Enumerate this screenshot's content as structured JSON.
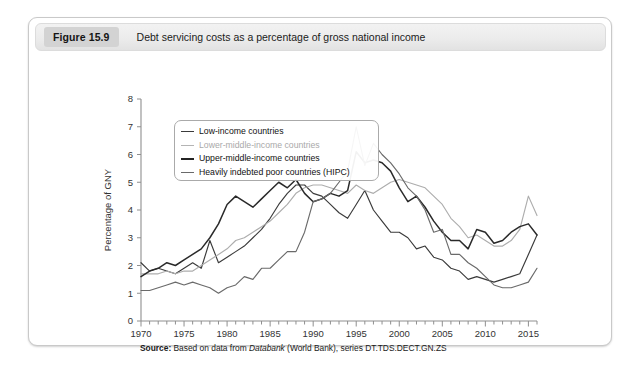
{
  "figure": {
    "badge": "Figure 15.9",
    "caption": "Debt servicing costs as a percentage of gross national income",
    "source_prefix": "Source:",
    "source_text_1": " Based on data from ",
    "source_db": "Databank",
    "source_text_2": " (World Bank), series DT.TDS.DECT.GN.ZS"
  },
  "legend": {
    "items": [
      {
        "label": "Low-income countries",
        "color": "#3b3b3b"
      },
      {
        "label": "Lower-middle-income countries",
        "color": "#b4b4b4"
      },
      {
        "label": "Upper-middle-income countries",
        "color": "#242424"
      },
      {
        "label": "Heavily indebted poor countries (HIPC)",
        "color": "#6a6a6a"
      }
    ]
  },
  "chart_data": {
    "type": "line",
    "title": "Debt servicing costs as a percentage of gross national income",
    "xlabel": "",
    "ylabel": "Percentage of GNY",
    "xlim": [
      1970,
      2016
    ],
    "ylim": [
      0,
      8
    ],
    "y_ticks": [
      0,
      1,
      2,
      3,
      4,
      5,
      6,
      7,
      8
    ],
    "x_ticks_major": [
      1970,
      1975,
      1980,
      1985,
      1990,
      1995,
      2000,
      2005,
      2010,
      2015
    ],
    "x_tick_interval_minor": 1,
    "grid": false,
    "legend_position": "top-left-inside",
    "x": [
      1970,
      1971,
      1972,
      1973,
      1974,
      1975,
      1976,
      1977,
      1978,
      1979,
      1980,
      1981,
      1982,
      1983,
      1984,
      1985,
      1986,
      1987,
      1988,
      1989,
      1990,
      1991,
      1992,
      1993,
      1994,
      1995,
      1996,
      1997,
      1998,
      1999,
      2000,
      2001,
      2002,
      2003,
      2004,
      2005,
      2006,
      2007,
      2008,
      2009,
      2010,
      2011,
      2012,
      2013,
      2014,
      2015,
      2016
    ],
    "series": [
      {
        "name": "Low-income countries",
        "color": "#3b3b3b",
        "values": [
          2.1,
          1.8,
          1.9,
          1.8,
          1.7,
          1.9,
          2.1,
          1.9,
          2.9,
          2.1,
          2.3,
          2.5,
          2.7,
          3.0,
          3.3,
          3.7,
          4.2,
          4.6,
          4.9,
          4.9,
          4.6,
          4.5,
          4.2,
          3.9,
          3.7,
          4.2,
          4.7,
          4.0,
          3.6,
          3.2,
          3.2,
          3.0,
          2.6,
          2.7,
          2.3,
          2.2,
          1.9,
          1.8,
          1.5,
          1.6,
          1.5,
          1.4,
          1.5,
          1.6,
          1.7,
          2.4,
          3.1
        ]
      },
      {
        "name": "Lower-middle-income countries",
        "color": "#b4b4b4",
        "values": [
          1.7,
          1.7,
          1.7,
          1.8,
          1.7,
          1.8,
          1.8,
          2.0,
          2.2,
          2.4,
          2.6,
          2.9,
          3.0,
          3.2,
          3.4,
          3.6,
          3.9,
          4.2,
          4.6,
          4.8,
          4.9,
          4.9,
          4.8,
          4.7,
          4.6,
          4.9,
          4.7,
          4.6,
          4.8,
          5.0,
          5.1,
          5.0,
          4.9,
          4.8,
          4.5,
          4.2,
          3.7,
          3.4,
          3.0,
          3.1,
          2.9,
          2.7,
          2.7,
          2.9,
          3.3,
          4.5,
          3.8
        ]
      },
      {
        "name": "Upper-middle-income countries",
        "color": "#242424",
        "values": [
          1.6,
          1.8,
          1.9,
          2.1,
          2.0,
          2.2,
          2.4,
          2.6,
          3.0,
          3.5,
          4.2,
          4.5,
          4.3,
          4.1,
          4.4,
          4.7,
          5.0,
          4.8,
          5.1,
          4.6,
          4.3,
          4.4,
          4.6,
          4.5,
          4.7,
          6.1,
          5.7,
          5.8,
          5.7,
          5.4,
          4.8,
          4.3,
          4.5,
          4.1,
          3.6,
          3.2,
          2.9,
          2.9,
          2.6,
          3.3,
          3.2,
          2.8,
          2.9,
          3.2,
          3.4,
          3.5,
          3.1
        ]
      },
      {
        "name": "Heavily indebted poor countries (HIPC)",
        "color": "#6a6a6a",
        "values": [
          1.1,
          1.1,
          1.2,
          1.3,
          1.4,
          1.3,
          1.4,
          1.3,
          1.2,
          1.0,
          1.2,
          1.3,
          1.6,
          1.5,
          1.9,
          1.9,
          2.2,
          2.5,
          2.5,
          3.2,
          4.3,
          4.4,
          4.6,
          5.0,
          5.4,
          7.0,
          5.6,
          6.4,
          6.0,
          5.7,
          5.3,
          4.8,
          4.5,
          4.0,
          3.2,
          3.3,
          2.4,
          2.4,
          2.1,
          1.9,
          1.6,
          1.3,
          1.2,
          1.2,
          1.3,
          1.4,
          1.9
        ]
      }
    ]
  }
}
